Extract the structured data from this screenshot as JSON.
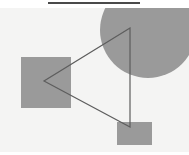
{
  "figure": {
    "title_rule": {
      "name": "horizontal-rule",
      "x": 48,
      "y": 2,
      "width": 92,
      "height": 2,
      "color": "#4a4a4a"
    },
    "canvas": {
      "x": 0,
      "y": 8,
      "width": 189,
      "height": 144,
      "background": "#f4f4f3"
    },
    "shapes": [
      {
        "id": "circle",
        "kind": "circle",
        "label": "gray-circle",
        "cx": 148,
        "cy": 22,
        "r": 48,
        "fill": "#9a9a9a",
        "clipped": "top-right"
      },
      {
        "id": "square-left",
        "kind": "rect",
        "label": "gray-square-left",
        "x": 21,
        "y": 49,
        "width": 50,
        "height": 51,
        "fill": "#9a9a9a"
      },
      {
        "id": "rect-bottom",
        "kind": "rect",
        "label": "gray-rectangle-bottom",
        "x": 117,
        "y": 114,
        "width": 35,
        "height": 23,
        "fill": "#9a9a9a"
      },
      {
        "id": "triangle",
        "kind": "polygon",
        "label": "triangle-outline",
        "points": "130,20 44,73 130,119",
        "stroke": "#5d5d5d",
        "stroke_width": 1.2,
        "fill": "none"
      }
    ]
  },
  "palette": {
    "background": "#ffffff",
    "canvas_background": "#f4f4f3",
    "shape_gray": "#9a9a9a",
    "outline_gray": "#5d5d5d",
    "rule_dark": "#4a4a4a"
  }
}
